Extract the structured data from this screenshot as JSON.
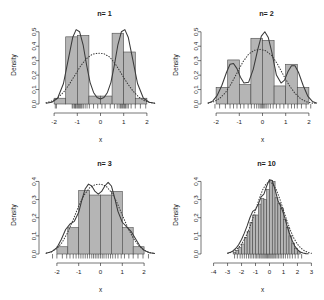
{
  "figure": {
    "panel_count": 4,
    "xlabel": "x",
    "ylabel": "Density"
  },
  "chart_data": [
    {
      "type": "bar",
      "title": "n= 1",
      "xlabel": "x",
      "ylabel": "Density",
      "xlim": [
        -2.35,
        2.35
      ],
      "ylim": [
        0,
        0.54
      ],
      "xticks": [
        -2,
        -1,
        0,
        1,
        2
      ],
      "xticklabels": [
        "-2",
        "-1",
        "0",
        "1",
        "2"
      ],
      "yticks": [
        0.0,
        0.1,
        0.2,
        0.3,
        0.4,
        0.5
      ],
      "yticklabels": [
        "0.0",
        "0.1",
        "0.2",
        "0.3",
        "0.4",
        "0.5"
      ],
      "grid": false,
      "legend": null,
      "bin_edges": [
        -2.0,
        -1.5,
        -1.0,
        -0.5,
        0.0,
        0.5,
        1.0,
        1.5,
        2.0
      ],
      "values": [
        0.04,
        0.465,
        0.475,
        0.055,
        0.055,
        0.49,
        0.36,
        0.04
      ],
      "series": [
        {
          "name": "density-estimate",
          "style": "solid",
          "x": [
            -2.35,
            -2.1,
            -1.85,
            -1.6,
            -1.4,
            -1.2,
            -1.05,
            -0.9,
            -0.75,
            -0.6,
            -0.45,
            -0.3,
            -0.15,
            0.0,
            0.15,
            0.3,
            0.45,
            0.6,
            0.75,
            0.9,
            1.05,
            1.2,
            1.4,
            1.6,
            1.85,
            2.1,
            2.35
          ],
          "y": [
            0.005,
            0.012,
            0.04,
            0.14,
            0.3,
            0.46,
            0.515,
            0.5,
            0.41,
            0.27,
            0.15,
            0.08,
            0.045,
            0.035,
            0.045,
            0.08,
            0.15,
            0.27,
            0.41,
            0.5,
            0.515,
            0.46,
            0.3,
            0.14,
            0.04,
            0.012,
            0.005
          ]
        },
        {
          "name": "reference-normal",
          "style": "dotted",
          "x": [
            -2.35,
            -2.1,
            -1.85,
            -1.6,
            -1.35,
            -1.1,
            -0.85,
            -0.6,
            -0.35,
            -0.1,
            0.15,
            0.4,
            0.65,
            0.9,
            1.15,
            1.4,
            1.65,
            1.9,
            2.15,
            2.35
          ],
          "y": [
            0.008,
            0.02,
            0.042,
            0.08,
            0.135,
            0.2,
            0.265,
            0.315,
            0.345,
            0.352,
            0.348,
            0.325,
            0.275,
            0.21,
            0.145,
            0.09,
            0.048,
            0.022,
            0.009,
            0.005
          ]
        }
      ],
      "rug_x": [
        -1.95,
        -1.9,
        -1.22,
        -1.18,
        -1.12,
        -1.08,
        -1.05,
        -1.0,
        -0.96,
        -0.92,
        -0.88,
        -0.84,
        -0.8,
        -0.74,
        -0.66,
        -0.58,
        -0.48,
        -0.3,
        -0.12,
        0.06,
        0.2,
        0.42,
        0.6,
        0.72,
        0.8,
        0.86,
        0.9,
        0.95,
        1.0,
        1.04,
        1.08,
        1.14,
        1.2,
        1.32,
        1.5,
        1.72,
        1.95
      ]
    },
    {
      "type": "bar",
      "title": "n= 2",
      "xlabel": "x",
      "ylabel": "Density",
      "xlim": [
        -2.35,
        2.35
      ],
      "ylim": [
        0,
        0.54
      ],
      "xticks": [
        -2,
        -1,
        0,
        1,
        2
      ],
      "xticklabels": [
        "-2",
        "-1",
        "0",
        "1",
        "2"
      ],
      "yticks": [
        0.0,
        0.1,
        0.2,
        0.3,
        0.4,
        0.5
      ],
      "yticklabels": [
        "0.0",
        "0.1",
        "0.2",
        "0.3",
        "0.4",
        "0.5"
      ],
      "grid": false,
      "legend": null,
      "bin_edges": [
        -2.0,
        -1.5,
        -1.0,
        -0.5,
        0.0,
        0.5,
        1.0,
        1.5,
        2.0
      ],
      "values": [
        0.115,
        0.305,
        0.135,
        0.455,
        0.44,
        0.125,
        0.275,
        0.115
      ],
      "series": [
        {
          "name": "density-estimate",
          "style": "solid",
          "x": [
            -2.35,
            -2.15,
            -1.95,
            -1.75,
            -1.55,
            -1.4,
            -1.25,
            -1.1,
            -0.95,
            -0.8,
            -0.6,
            -0.4,
            -0.2,
            -0.05,
            0.1,
            0.25,
            0.4,
            0.6,
            0.8,
            0.95,
            1.1,
            1.25,
            1.4,
            1.55,
            1.75,
            1.95,
            2.15,
            2.35
          ],
          "y": [
            0.005,
            0.02,
            0.06,
            0.13,
            0.22,
            0.275,
            0.28,
            0.245,
            0.185,
            0.145,
            0.15,
            0.24,
            0.38,
            0.47,
            0.5,
            0.46,
            0.36,
            0.2,
            0.145,
            0.165,
            0.225,
            0.265,
            0.265,
            0.22,
            0.13,
            0.055,
            0.018,
            0.005
          ]
        },
        {
          "name": "reference-normal",
          "style": "dotted",
          "x": [
            -2.35,
            -2.1,
            -1.85,
            -1.6,
            -1.35,
            -1.1,
            -0.85,
            -0.6,
            -0.35,
            -0.1,
            0.15,
            0.4,
            0.65,
            0.9,
            1.15,
            1.4,
            1.65,
            1.9,
            2.15,
            2.35
          ],
          "y": [
            0.006,
            0.016,
            0.038,
            0.078,
            0.14,
            0.215,
            0.29,
            0.345,
            0.372,
            0.378,
            0.368,
            0.335,
            0.275,
            0.2,
            0.13,
            0.074,
            0.036,
            0.015,
            0.006,
            0.004
          ]
        }
      ],
      "rug_x": [
        -2.05,
        -1.85,
        -1.6,
        -1.4,
        -1.25,
        -1.1,
        -0.95,
        -0.8,
        -0.62,
        -0.48,
        -0.35,
        -0.25,
        -0.16,
        -0.1,
        -0.05,
        0.0,
        0.05,
        0.1,
        0.16,
        0.24,
        0.34,
        0.46,
        0.6,
        0.75,
        0.92,
        1.1,
        1.25,
        1.38,
        1.5,
        1.68,
        1.88,
        2.08
      ]
    },
    {
      "type": "bar",
      "title": "n= 3",
      "xlabel": "x",
      "ylabel": "Density",
      "xlim": [
        -2.5,
        2.5
      ],
      "ylim": [
        0,
        0.43
      ],
      "xticks": [
        -2,
        -1,
        0,
        1,
        2
      ],
      "xticklabels": [
        "-2",
        "-1",
        "0",
        "1",
        "2"
      ],
      "yticks": [
        0.0,
        0.1,
        0.2,
        0.3,
        0.4
      ],
      "yticklabels": [
        "0.0",
        "0.1",
        "0.2",
        "0.3",
        "0.4"
      ],
      "grid": false,
      "legend": null,
      "bin_edges": [
        -2.0,
        -1.5,
        -1.0,
        -0.5,
        0.0,
        0.5,
        1.0,
        1.5,
        2.0
      ],
      "values": [
        0.04,
        0.145,
        0.35,
        0.325,
        0.325,
        0.345,
        0.145,
        0.04
      ],
      "series": [
        {
          "name": "density-estimate",
          "style": "solid",
          "x": [
            -2.5,
            -2.25,
            -2.0,
            -1.8,
            -1.6,
            -1.4,
            -1.2,
            -1.0,
            -0.85,
            -0.7,
            -0.55,
            -0.4,
            -0.25,
            -0.1,
            0.05,
            0.2,
            0.35,
            0.5,
            0.65,
            0.8,
            1.0,
            1.2,
            1.4,
            1.6,
            1.8,
            2.0,
            2.25,
            2.5
          ],
          "y": [
            0.004,
            0.012,
            0.035,
            0.08,
            0.135,
            0.165,
            0.18,
            0.23,
            0.3,
            0.36,
            0.385,
            0.375,
            0.345,
            0.33,
            0.345,
            0.375,
            0.395,
            0.375,
            0.31,
            0.235,
            0.175,
            0.15,
            0.125,
            0.085,
            0.045,
            0.02,
            0.007,
            0.003
          ]
        },
        {
          "name": "reference-normal",
          "style": "dotted",
          "x": [
            -2.5,
            -2.25,
            -2.0,
            -1.75,
            -1.5,
            -1.25,
            -1.0,
            -0.75,
            -0.5,
            -0.25,
            0.0,
            0.25,
            0.5,
            0.75,
            1.0,
            1.25,
            1.5,
            1.75,
            2.0,
            2.25,
            2.5
          ],
          "y": [
            0.004,
            0.012,
            0.03,
            0.065,
            0.12,
            0.19,
            0.265,
            0.325,
            0.365,
            0.382,
            0.385,
            0.375,
            0.34,
            0.285,
            0.215,
            0.145,
            0.088,
            0.046,
            0.021,
            0.008,
            0.003
          ]
        }
      ],
      "rug_x": [
        -2.2,
        -2.0,
        -1.75,
        -1.55,
        -1.4,
        -1.25,
        -1.12,
        -1.0,
        -0.9,
        -0.8,
        -0.7,
        -0.6,
        -0.5,
        -0.4,
        -0.32,
        -0.24,
        -0.16,
        -0.08,
        0.0,
        0.08,
        0.16,
        0.26,
        0.36,
        0.46,
        0.56,
        0.68,
        0.8,
        0.95,
        1.1,
        1.3,
        1.5,
        1.72,
        1.95,
        2.2
      ]
    },
    {
      "type": "bar",
      "title": "n= 10",
      "xlabel": "x",
      "ylabel": "Density",
      "xlim": [
        -4.4,
        3.4
      ],
      "ylim": [
        0,
        0.43
      ],
      "xticks": [
        -4,
        -3,
        -2,
        -1,
        0,
        1,
        2,
        3
      ],
      "xticklabels": [
        "-4",
        "-3",
        "-2",
        "-1",
        "0",
        "1",
        "2",
        "3"
      ],
      "yticks": [
        0.0,
        0.1,
        0.2,
        0.3,
        0.4
      ],
      "yticklabels": [
        "0.0",
        "0.1",
        "0.2",
        "0.3",
        "0.4"
      ],
      "grid": false,
      "legend": null,
      "bin_edges": [
        -2.6,
        -2.4,
        -2.2,
        -2.0,
        -1.8,
        -1.6,
        -1.4,
        -1.2,
        -1.0,
        -0.8,
        -0.6,
        -0.4,
        -0.2,
        0.0,
        0.2,
        0.4,
        0.6,
        0.8,
        1.0,
        1.2,
        1.4,
        1.6,
        1.8,
        2.0,
        2.2
      ],
      "values": [
        0.01,
        0.02,
        0.035,
        0.055,
        0.09,
        0.125,
        0.175,
        0.215,
        0.215,
        0.275,
        0.305,
        0.3,
        0.355,
        0.405,
        0.4,
        0.31,
        0.28,
        0.25,
        0.19,
        0.145,
        0.1,
        0.06,
        0.03,
        0.012
      ],
      "series": [
        {
          "name": "density-estimate",
          "style": "solid",
          "x": [
            -3.0,
            -2.8,
            -2.6,
            -2.4,
            -2.2,
            -2.0,
            -1.8,
            -1.6,
            -1.4,
            -1.2,
            -1.0,
            -0.8,
            -0.6,
            -0.4,
            -0.2,
            0.0,
            0.2,
            0.4,
            0.6,
            0.8,
            1.0,
            1.2,
            1.4,
            1.6,
            1.8,
            2.0,
            2.2,
            2.4,
            2.6,
            2.8
          ],
          "y": [
            0.004,
            0.009,
            0.018,
            0.032,
            0.052,
            0.08,
            0.115,
            0.155,
            0.2,
            0.235,
            0.245,
            0.275,
            0.315,
            0.33,
            0.375,
            0.41,
            0.405,
            0.355,
            0.295,
            0.265,
            0.225,
            0.17,
            0.12,
            0.078,
            0.045,
            0.024,
            0.011,
            0.005,
            0.002,
            0.001
          ]
        },
        {
          "name": "reference-normal",
          "style": "dotted",
          "x": [
            -3.0,
            -2.75,
            -2.5,
            -2.25,
            -2.0,
            -1.75,
            -1.5,
            -1.25,
            -1.0,
            -0.75,
            -0.5,
            -0.25,
            0.0,
            0.25,
            0.5,
            0.75,
            1.0,
            1.25,
            1.5,
            1.75,
            2.0,
            2.25,
            2.5,
            2.75,
            3.0
          ],
          "y": [
            0.004,
            0.009,
            0.018,
            0.032,
            0.054,
            0.086,
            0.13,
            0.183,
            0.242,
            0.301,
            0.352,
            0.386,
            0.399,
            0.386,
            0.352,
            0.301,
            0.242,
            0.183,
            0.13,
            0.086,
            0.054,
            0.032,
            0.018,
            0.009,
            0.004
          ]
        }
      ],
      "rug_x": [
        -2.5,
        -2.3,
        -2.1,
        -1.95,
        -1.8,
        -1.65,
        -1.5,
        -1.38,
        -1.26,
        -1.14,
        -1.02,
        -0.92,
        -0.82,
        -0.72,
        -0.62,
        -0.54,
        -0.46,
        -0.38,
        -0.3,
        -0.22,
        -0.14,
        -0.06,
        0.02,
        0.1,
        0.18,
        0.26,
        0.34,
        0.44,
        0.54,
        0.64,
        0.76,
        0.88,
        1.0,
        1.14,
        1.3,
        1.46,
        1.64,
        1.84,
        2.05,
        2.3
      ]
    }
  ]
}
